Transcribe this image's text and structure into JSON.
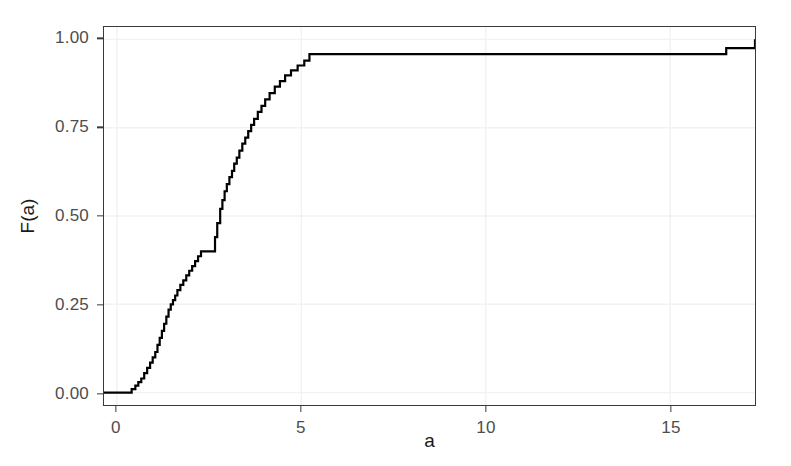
{
  "chart_data": {
    "type": "line",
    "subtype": "ecdf-step",
    "title": "",
    "xlabel": "a",
    "ylabel": "F(a)",
    "xlim": [
      -0.35,
      17.3
    ],
    "ylim": [
      -0.035,
      1.035
    ],
    "xticks": [
      0,
      5,
      10,
      15
    ],
    "xticklabels": [
      "0",
      "5",
      "10",
      "15"
    ],
    "yticks": [
      0.0,
      0.25,
      0.5,
      0.75,
      1.0
    ],
    "yticklabels": [
      "0.00",
      "0.25",
      "0.50",
      "0.75",
      "1.00"
    ],
    "grid": true,
    "grid_color": "#f2f2f2",
    "legend": "none",
    "line_color": "#000000",
    "line_width": 2.2,
    "panel_border_color": "#3a3a3a",
    "background": "#ffffff",
    "series": [
      {
        "name": "ECDF",
        "step": "hv",
        "x": [
          -0.35,
          0.34,
          0.4,
          0.5,
          0.58,
          0.66,
          0.74,
          0.82,
          0.9,
          0.97,
          1.04,
          1.1,
          1.16,
          1.22,
          1.28,
          1.34,
          1.4,
          1.46,
          1.52,
          1.58,
          1.64,
          1.72,
          1.8,
          1.88,
          1.96,
          2.04,
          2.12,
          2.2,
          2.28,
          2.36,
          2.44,
          2.52,
          2.6,
          2.66,
          2.72,
          2.8,
          2.86,
          2.92,
          2.98,
          3.05,
          3.12,
          3.18,
          3.25,
          3.32,
          3.4,
          3.48,
          3.56,
          3.64,
          3.72,
          3.82,
          3.92,
          4.02,
          4.14,
          4.28,
          4.42,
          4.56,
          4.72,
          4.9,
          5.08,
          5.22,
          7.92,
          16.52,
          17.3
        ],
        "y": [
          0.0,
          0.0,
          0.01,
          0.02,
          0.03,
          0.04,
          0.055,
          0.07,
          0.085,
          0.1,
          0.115,
          0.135,
          0.155,
          0.175,
          0.195,
          0.215,
          0.235,
          0.25,
          0.262,
          0.275,
          0.29,
          0.305,
          0.318,
          0.332,
          0.345,
          0.358,
          0.372,
          0.386,
          0.4,
          0.4,
          0.4,
          0.4,
          0.4,
          0.44,
          0.48,
          0.52,
          0.545,
          0.57,
          0.59,
          0.61,
          0.628,
          0.648,
          0.665,
          0.685,
          0.705,
          0.722,
          0.74,
          0.758,
          0.775,
          0.795,
          0.812,
          0.83,
          0.848,
          0.866,
          0.882,
          0.898,
          0.912,
          0.926,
          0.94,
          0.958,
          0.958,
          0.975,
          1.0
        ],
        "annotations": [
          {
            "label": "flat at zero until a≈0.35",
            "x": 0.34,
            "y": 0.0
          },
          {
            "label": "plateau at F≈0.40 over a≈2.3–2.6",
            "x": 2.45,
            "y": 0.4
          },
          {
            "label": "step to F≈0.958 at a≈5.2",
            "x": 5.22,
            "y": 0.958
          },
          {
            "label": "step to F≈0.975 at a≈7.9",
            "x": 7.92,
            "y": 0.975
          },
          {
            "label": "final step to F=1.00 at a≈16.5",
            "x": 16.52,
            "y": 1.0
          }
        ]
      }
    ]
  },
  "axes": {
    "x": {
      "title": "a",
      "ticks": [
        {
          "value": 0,
          "label": "0"
        },
        {
          "value": 5,
          "label": "5"
        },
        {
          "value": 10,
          "label": "10"
        },
        {
          "value": 15,
          "label": "15"
        }
      ]
    },
    "y": {
      "title": "F(a)",
      "ticks": [
        {
          "value": 1.0,
          "label": "1.00"
        },
        {
          "value": 0.75,
          "label": "0.75"
        },
        {
          "value": 0.5,
          "label": "0.50"
        },
        {
          "value": 0.25,
          "label": "0.25"
        },
        {
          "value": 0.0,
          "label": "0.00"
        }
      ]
    }
  }
}
